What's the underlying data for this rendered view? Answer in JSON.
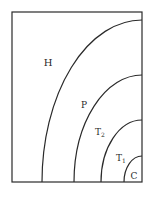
{
  "diagram": {
    "stroke_color": "#2a2a2a",
    "background": "#ffffff",
    "frame": {
      "x": 12,
      "y": 12,
      "width": 130,
      "height": 170
    },
    "center": {
      "x": 142,
      "y": 182
    },
    "arcs": [
      {
        "name": "boundary-h-p",
        "rx": 100,
        "ry": 162
      },
      {
        "name": "boundary-p-t2",
        "rx": 68,
        "ry": 107
      },
      {
        "name": "boundary-t2-t1",
        "rx": 41,
        "ry": 62
      },
      {
        "name": "boundary-t1-c",
        "rx": 18,
        "ry": 26
      }
    ],
    "regions": [
      {
        "name": "region-h",
        "label": "H",
        "sub": "",
        "x": 48,
        "y": 66,
        "size": 10
      },
      {
        "name": "region-p",
        "label": "P",
        "sub": "",
        "x": 84,
        "y": 108,
        "size": 9
      },
      {
        "name": "region-t2",
        "label": "T",
        "sub": "2",
        "x": 100,
        "y": 135,
        "size": 9
      },
      {
        "name": "region-t1",
        "label": "T",
        "sub": "1",
        "x": 121,
        "y": 161,
        "size": 9
      },
      {
        "name": "region-c",
        "label": "C",
        "sub": "",
        "x": 134,
        "y": 179,
        "size": 9
      }
    ]
  }
}
